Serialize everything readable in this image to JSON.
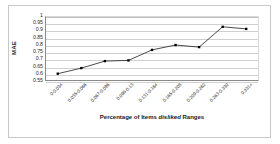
{
  "chart_data": {
    "type": "line",
    "title": "",
    "xlabel": "Percentage of Items disliked Ranges",
    "ylabel": "MAE",
    "categories": [
      "0-0.034",
      "0.035-0.066",
      "0.067-0.096",
      "0.096-0.13",
      "0.131-0.164",
      "0.165-0.208",
      "0.209-0.262",
      "0.263-0.330",
      "0.331+"
    ],
    "values": [
      0.595,
      0.635,
      0.685,
      0.69,
      0.765,
      0.8,
      0.785,
      0.93,
      0.915
    ],
    "ylim": [
      0.55,
      1.0
    ],
    "yticks": [
      "1",
      "0.95",
      "0.9",
      "0.85",
      "0.8",
      "0.75",
      "0.7",
      "0.65",
      "0.6",
      "0.55"
    ],
    "ytick_values": [
      1,
      0.95,
      0.9,
      0.85,
      0.8,
      0.75,
      0.7,
      0.65,
      0.6,
      0.55
    ],
    "grid": true,
    "legend": "none",
    "series_color": "#000000",
    "marker": "square",
    "grid_color": "#d0d0d0",
    "axis_color": "#8a8a8a"
  },
  "xaxis_title_parts": {
    "before": "Percentage of Items ",
    "italic": "disliked",
    "after": " Ranges"
  }
}
